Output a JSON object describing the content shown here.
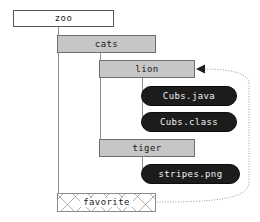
{
  "diagram": {
    "colors": {
      "root_fill": "#ffffff",
      "folder_fill": "#c6c6c6",
      "file_fill": "#1c1c1c",
      "file_text": "#f2f2f2",
      "border": "#6e6e6e",
      "connector": "#8f8f8f",
      "reference_edge": "#9a9a9a",
      "hatch": "#969696"
    },
    "nodes": [
      {
        "id": "zoo",
        "label": "zoo",
        "kind": "root",
        "x": 13,
        "y": 10,
        "w": 101,
        "h": 17
      },
      {
        "id": "cats",
        "label": "cats",
        "kind": "folder",
        "x": 57,
        "y": 35,
        "w": 99,
        "h": 18
      },
      {
        "id": "lion",
        "label": "lion",
        "kind": "folder",
        "x": 99,
        "y": 60,
        "w": 96,
        "h": 18
      },
      {
        "id": "cubs-java",
        "label": "Cubs.java",
        "kind": "file",
        "x": 141,
        "y": 86,
        "w": 96,
        "h": 20
      },
      {
        "id": "cubs-class",
        "label": "Cubs.class",
        "kind": "file",
        "x": 141,
        "y": 112,
        "w": 96,
        "h": 20
      },
      {
        "id": "tiger",
        "label": "tiger",
        "kind": "folder",
        "x": 99,
        "y": 139,
        "w": 96,
        "h": 18
      },
      {
        "id": "stripes-png",
        "label": "stripes.png",
        "kind": "file",
        "x": 141,
        "y": 164,
        "w": 99,
        "h": 20
      },
      {
        "id": "favorite",
        "label": "favorite",
        "kind": "hatched",
        "x": 57,
        "y": 193,
        "w": 99,
        "h": 19
      }
    ],
    "connectors": [
      {
        "from": "zoo",
        "to": "cats",
        "orient": "v",
        "x": 58,
        "y": 27,
        "len": 9
      },
      {
        "from": "zoo",
        "to": "cats",
        "orient": "h",
        "x": 58,
        "y": 35,
        "len": 1
      },
      {
        "from": "zoo",
        "to": "favorite",
        "orient": "v",
        "x": 58,
        "y": 27,
        "len": 176
      },
      {
        "from": "zoo",
        "to": "favorite",
        "orient": "h",
        "x": 58,
        "y": 202,
        "len": 1
      },
      {
        "from": "cats",
        "to": "lion",
        "orient": "v",
        "x": 100,
        "y": 53,
        "len": 8
      },
      {
        "from": "cats",
        "to": "tiger",
        "orient": "v",
        "x": 100,
        "y": 53,
        "len": 95
      },
      {
        "from": "lion",
        "to": "cubs-java",
        "orient": "v",
        "x": 142,
        "y": 78,
        "len": 19
      },
      {
        "from": "lion",
        "to": "cubs-class",
        "orient": "v",
        "x": 142,
        "y": 78,
        "len": 45
      },
      {
        "from": "tiger",
        "to": "stripes-png",
        "orient": "v",
        "x": 142,
        "y": 157,
        "len": 20
      }
    ],
    "reference_edge": {
      "label": "favorite points to lion",
      "style": "dotted",
      "source": "favorite",
      "target": "lion",
      "arrow": "left",
      "path": "M 157 202 C 210 202 249 199 249 182 L 249 84 C 249 72 228 69 201 69",
      "arrow_points": "201,69 208,65.5 208,72.5"
    }
  }
}
